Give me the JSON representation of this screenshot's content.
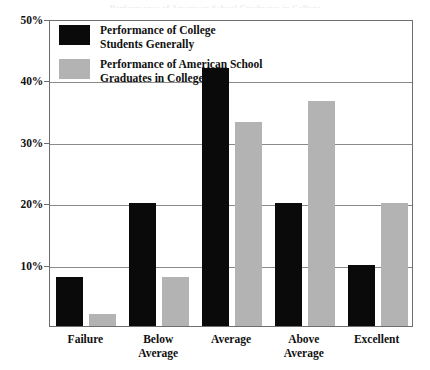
{
  "top_ghost_text": "Performance of American School Graduates in College",
  "legend": {
    "entries": [
      {
        "swatch": "black",
        "line1": "Performance of College",
        "line2": "Students Generally"
      },
      {
        "swatch": "gray",
        "line1": "Performance of American School",
        "line2": "Graduates in College"
      }
    ]
  },
  "axis": {
    "y_ticks": [
      "10%",
      "20%",
      "30%",
      "40%",
      "50%"
    ],
    "x_labels": [
      {
        "line1": "Failure",
        "line2": ""
      },
      {
        "line1": "Below",
        "line2": "Average"
      },
      {
        "line1": "Average",
        "line2": ""
      },
      {
        "line1": "Above",
        "line2": "Average"
      },
      {
        "line1": "Excellent",
        "line2": ""
      }
    ]
  },
  "colors": {
    "series_black": "#0a0a0a",
    "series_gray": "#b3b3b3",
    "frame": "#6e6e6e",
    "grid": "#8a8a8a",
    "background": "#ffffff"
  },
  "chart_data": {
    "type": "bar",
    "title": "",
    "xlabel": "",
    "ylabel": "",
    "ylim": [
      0,
      50
    ],
    "ytick_values": [
      10,
      20,
      30,
      40,
      50
    ],
    "ytick_suffix": "%",
    "grid": true,
    "legend_position": "inside-top-left",
    "categories": [
      "Failure",
      "Below Average",
      "Average",
      "Above Average",
      "Excellent"
    ],
    "series": [
      {
        "name": "Performance of College Students Generally",
        "color": "#0a0a0a",
        "values": [
          8,
          20,
          42,
          20,
          10
        ]
      },
      {
        "name": "Performance of American School Graduates in College",
        "color": "#b3b3b3",
        "values": [
          2,
          8,
          33.3,
          36.7,
          20
        ]
      }
    ]
  }
}
